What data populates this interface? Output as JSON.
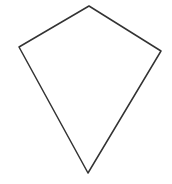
{
  "shape": {
    "type": "kite",
    "stroke_color": "#333333",
    "fill_color": "#ffffff",
    "stroke_width": 1.5,
    "vertices": {
      "top": [
        89,
        6
      ],
      "right": [
        161,
        51
      ],
      "bottom": [
        88,
        173
      ],
      "left": [
        19,
        47
      ]
    }
  }
}
